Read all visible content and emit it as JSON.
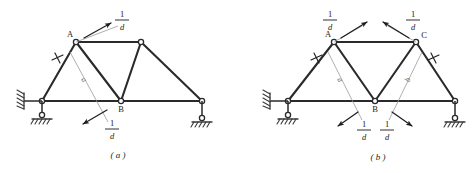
{
  "figure": {
    "background_color": "#ffffff",
    "line_color": "#2a2a2a",
    "guide_color": "#9a9a9a"
  },
  "panels": [
    {
      "id": "a",
      "caption": "( a )",
      "node_labels": [
        {
          "name": "A",
          "text": "A"
        },
        {
          "name": "B",
          "text": "B"
        }
      ],
      "member_labels": [
        {
          "name": "member-a",
          "text": "a"
        }
      ],
      "force_labels": [
        {
          "name": "force-upper-right",
          "numerator": "1",
          "denominator": "d"
        },
        {
          "name": "force-lower-left",
          "numerator": "1",
          "denominator": "d"
        }
      ],
      "supports": [
        {
          "name": "left-support",
          "type": "pin-with-horizontal-link"
        },
        {
          "name": "right-support",
          "type": "roller-on-link"
        }
      ]
    },
    {
      "id": "b",
      "caption": "( b )",
      "node_labels": [
        {
          "name": "A",
          "text": "A"
        },
        {
          "name": "B",
          "text": "B"
        },
        {
          "name": "C",
          "text": "C"
        }
      ],
      "member_labels": [
        {
          "name": "member-a",
          "text": "a"
        },
        {
          "name": "member-b",
          "text": "b"
        }
      ],
      "force_labels": [
        {
          "name": "force-upper-left",
          "numerator": "1",
          "denominator": "d"
        },
        {
          "name": "force-upper-right",
          "numerator": "1",
          "denominator": "d"
        },
        {
          "name": "force-lower-left",
          "numerator": "1",
          "denominator": "d"
        },
        {
          "name": "force-lower-right",
          "numerator": "1",
          "denominator": "d"
        }
      ],
      "supports": [
        {
          "name": "left-support",
          "type": "pin-with-horizontal-link"
        },
        {
          "name": "right-support",
          "type": "roller-on-link"
        }
      ]
    }
  ]
}
